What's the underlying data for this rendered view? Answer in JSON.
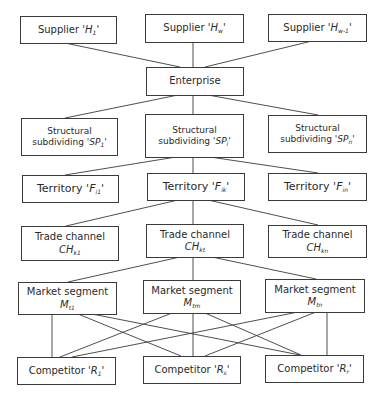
{
  "diagram": {
    "type": "hierarchy",
    "levels": [
      {
        "name": "suppliers",
        "nodes": [
          {
            "id": "H1",
            "label": "Supplier",
            "symbol": "H",
            "sub": "1",
            "text": "Supplier 'H1'"
          },
          {
            "id": "Hw",
            "label": "Supplier",
            "symbol": "H",
            "sub": "w",
            "text": "Supplier 'Hw'"
          },
          {
            "id": "Hw-1",
            "label": "Supplier",
            "symbol": "H",
            "sub": "w-1",
            "text": "Supplier 'Hw-1'"
          }
        ]
      },
      {
        "name": "enterprise",
        "nodes": [
          {
            "id": "E",
            "label": "Enterprise",
            "text": "Enterprise"
          }
        ]
      },
      {
        "name": "structural-subdividing",
        "nodes": [
          {
            "id": "SP1",
            "label": "Structural",
            "label2": "subdividing",
            "symbol": "SP",
            "sub": "1",
            "text": "Structural subdividing 'SP1'"
          },
          {
            "id": "SPi",
            "label": "Structural",
            "label2": "subdividing",
            "symbol": "SP",
            "sub": "i",
            "text": "Structural subdividing 'SPi'"
          },
          {
            "id": "SPn",
            "label": "Structural",
            "label2": "subdividing",
            "symbol": "SP",
            "sub": "n",
            "text": "Structural subdividing 'SPn'"
          }
        ]
      },
      {
        "name": "territory",
        "nodes": [
          {
            "id": "Fi1",
            "label": "Territory",
            "symbol": "F",
            "sub": "i1",
            "text": "Territory 'Fi1'"
          },
          {
            "id": "Fik",
            "label": "Territory",
            "symbol": "F",
            "sub": "ik",
            "text": "Territory 'Fik'"
          },
          {
            "id": "Fin",
            "label": "Territory",
            "symbol": "F",
            "sub": "in",
            "text": "Territory 'Fin'"
          }
        ]
      },
      {
        "name": "trade-channel",
        "nodes": [
          {
            "id": "CHk1",
            "label": "Trade channel",
            "symbol": "CH",
            "sub": "k1",
            "text": "Trade channel CHk1"
          },
          {
            "id": "CHkt",
            "label": "Trade channel",
            "symbol": "CH",
            "sub": "kt",
            "text": "Trade channel CHkt"
          },
          {
            "id": "CHkn",
            "label": "Trade channel",
            "symbol": "CH",
            "sub": "kn",
            "text": "Trade channel CHkn"
          }
        ]
      },
      {
        "name": "market-segment",
        "nodes": [
          {
            "id": "Mt1",
            "label": "Market segment",
            "symbol": "M",
            "sub": "t1",
            "text": "Market segment Mt1"
          },
          {
            "id": "Mtm",
            "label": "Market segment",
            "symbol": "M",
            "sub": "tm",
            "text": "Market segment Mtm"
          },
          {
            "id": "Mtn",
            "label": "Market segment",
            "symbol": "M",
            "sub": "tn",
            "text": "Market segment Mtn"
          }
        ]
      },
      {
        "name": "competitors",
        "nodes": [
          {
            "id": "R1",
            "label": "Competitor",
            "symbol": "R",
            "sub": "1",
            "text": "Competitor 'R1'"
          },
          {
            "id": "Rs",
            "label": "Competitor",
            "symbol": "R",
            "sub": "s",
            "text": "Competitor 'Rs'"
          },
          {
            "id": "Rr",
            "label": "Competitor",
            "symbol": "R",
            "sub": "r",
            "text": "Competitor 'Rr'"
          }
        ]
      }
    ],
    "edges": [
      [
        "H1",
        "E"
      ],
      [
        "Hw",
        "E"
      ],
      [
        "Hw-1",
        "E"
      ],
      [
        "E",
        "SP1"
      ],
      [
        "E",
        "SPi"
      ],
      [
        "E",
        "SPn"
      ],
      [
        "SPi",
        "Fi1"
      ],
      [
        "SPi",
        "Fik"
      ],
      [
        "SPi",
        "Fin"
      ],
      [
        "Fik",
        "CHk1"
      ],
      [
        "Fik",
        "CHkt"
      ],
      [
        "Fik",
        "CHkn"
      ],
      [
        "CHkt",
        "Mt1"
      ],
      [
        "CHkt",
        "Mtm"
      ],
      [
        "CHkt",
        "Mtn"
      ],
      [
        "Mt1",
        "R1"
      ],
      [
        "Mt1",
        "Rs"
      ],
      [
        "Mt1",
        "Rr"
      ],
      [
        "Mtm",
        "R1"
      ],
      [
        "Mtm",
        "Rs"
      ],
      [
        "Mtm",
        "Rr"
      ],
      [
        "Mtn",
        "R1"
      ],
      [
        "Mtn",
        "Rs"
      ],
      [
        "Mtn",
        "Rr"
      ]
    ]
  }
}
